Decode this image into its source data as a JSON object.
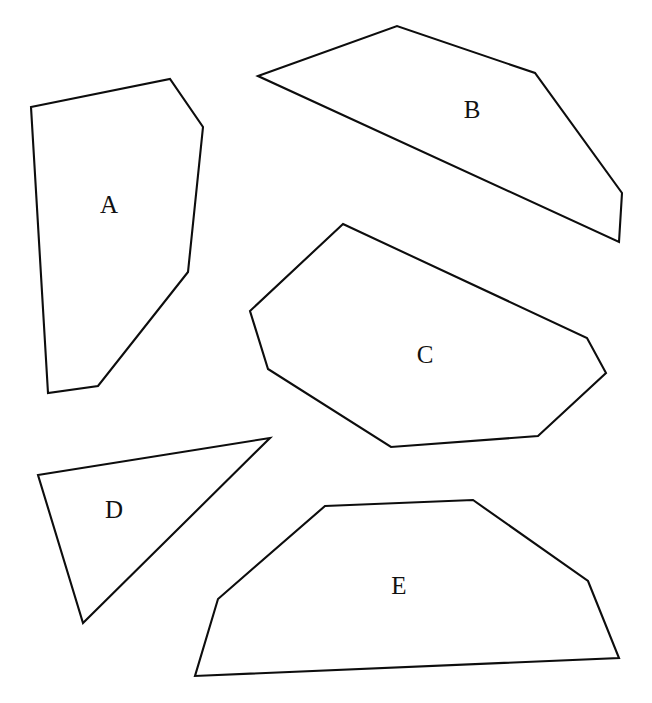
{
  "figure": {
    "kind": "geometry-polygon-set",
    "background_color": "#ffffff",
    "stroke_color": "#0d0d0d",
    "fill_color": "#ffffff",
    "stroke_width": 2.1,
    "canvas": {
      "width": 652,
      "height": 703
    },
    "label_font_size": 25,
    "shape_count": 5,
    "shapes": [
      {
        "label": "A",
        "sides": 6,
        "label_position": {
          "x": 109,
          "y": 207
        },
        "points": "31,107 170,79 203,127 188,272 98,386 48,393"
      },
      {
        "label": "B",
        "sides": 5,
        "label_position": {
          "x": 472,
          "y": 112
        },
        "points": "258,76 397,26 535,73 622,193 619,242"
      },
      {
        "label": "C",
        "sides": 7,
        "label_position": {
          "x": 425,
          "y": 357
        },
        "points": "343,224 587,338 606,373 538,436 391,447 268,369 250,311"
      },
      {
        "label": "D",
        "sides": 3,
        "label_position": {
          "x": 114,
          "y": 512
        },
        "points": "38,475 270,438 83,623"
      },
      {
        "label": "E",
        "sides": 6,
        "label_position": {
          "x": 399,
          "y": 588
        },
        "points": "325,506 473,500 588,581 619,658 195,676 218,599"
      }
    ]
  }
}
